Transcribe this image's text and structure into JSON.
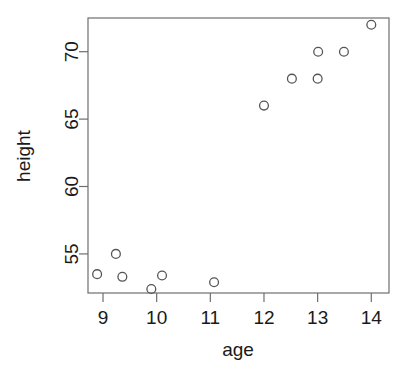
{
  "chart_data": {
    "type": "scatter",
    "title": "",
    "xlabel": "age",
    "ylabel": "height",
    "xlim": [
      8.72,
      14.33
    ],
    "ylim": [
      52.1,
      72.5
    ],
    "xticks": [
      9,
      10,
      11,
      12,
      13,
      14
    ],
    "yticks": [
      55,
      60,
      65,
      70
    ],
    "xtick_labels": [
      "9",
      "10",
      "11",
      "12",
      "13",
      "14"
    ],
    "ytick_labels": [
      "55",
      "60",
      "65",
      "70"
    ],
    "grid": false,
    "legend": null,
    "marker": "open-circle",
    "marker_color": "#555555",
    "points": [
      {
        "x": 8.89,
        "y": 53.5
      },
      {
        "x": 9.24,
        "y": 55.0
      },
      {
        "x": 9.36,
        "y": 53.3
      },
      {
        "x": 9.9,
        "y": 52.4
      },
      {
        "x": 10.1,
        "y": 53.4
      },
      {
        "x": 11.07,
        "y": 52.9
      },
      {
        "x": 12.0,
        "y": 66.0
      },
      {
        "x": 12.52,
        "y": 68.0
      },
      {
        "x": 13.0,
        "y": 68.0
      },
      {
        "x": 13.01,
        "y": 70.0
      },
      {
        "x": 13.49,
        "y": 70.0
      },
      {
        "x": 14.0,
        "y": 72.0
      }
    ]
  },
  "axes": {
    "x_title": "age",
    "y_title": "height"
  },
  "colors": {
    "frame": "#6e6e6e",
    "marker": "#555555",
    "text": "#1a1a1a",
    "background": "#ffffff"
  }
}
